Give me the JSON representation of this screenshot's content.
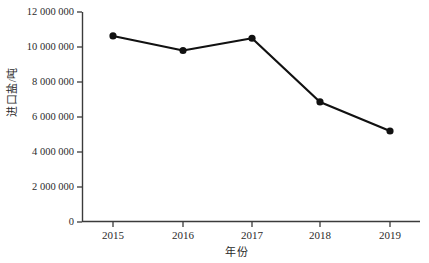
{
  "chart_data": {
    "type": "line",
    "title": "",
    "subtitle": "",
    "xlabel": "年份",
    "ylabel": "进口盐/吨",
    "categories": [
      "2015",
      "2016",
      "2017",
      "2018",
      "2019"
    ],
    "values": [
      10630000,
      9800000,
      10500000,
      6860000,
      5200000
    ],
    "series": [
      {
        "name": "进口盐",
        "values": [
          10630000,
          9800000,
          10500000,
          6860000,
          5200000
        ]
      }
    ],
    "ylim": [
      0,
      12000000
    ],
    "yticks": [
      0,
      2000000,
      4000000,
      6000000,
      8000000,
      10000000,
      12000000
    ],
    "ytick_labels": [
      "0",
      "2 000 000",
      "4 000 000",
      "6 000 000",
      "8 000 000",
      "10 000 000",
      "12 000 000"
    ],
    "xtick_labels": [
      "2015",
      "2016",
      "2017",
      "2018",
      "2019"
    ],
    "grid": false,
    "legend": "none",
    "line_color": "#111111",
    "marker": "circle",
    "marker_color": "#111111",
    "axis_color": "#3b3b3b",
    "background_color": "#ffffff"
  }
}
